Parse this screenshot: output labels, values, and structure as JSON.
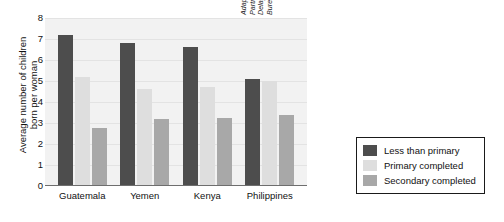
{
  "chart_data": {
    "type": "bar",
    "title": "",
    "xlabel": "",
    "ylabel": "Average number of children\nborn per woman",
    "ylim": [
      0,
      8
    ],
    "yticks": [
      "8",
      "7",
      "6",
      "5",
      "4",
      "3",
      "2",
      "1",
      "0"
    ],
    "grid": true,
    "legend_position": "right",
    "categories": [
      "Guatemala",
      "Yemen",
      "Kenya",
      "Philippines"
    ],
    "series": [
      {
        "name": "Less  than primary",
        "color": "#4d4d4d",
        "values": [
          7.2,
          6.8,
          6.6,
          5.1
        ]
      },
      {
        "name": "Primary completed",
        "color": "#dedede",
        "values": [
          5.2,
          4.6,
          4.7,
          5.0
        ]
      },
      {
        "name": "Secondary completed",
        "color": "#a8a8a8",
        "values": [
          2.75,
          3.2,
          3.25,
          3.4
        ]
      }
    ],
    "annotations": {
      "source": "Adapted from E. Murphy, and D. Carr, Powerful\nPartners: Adolescent Girls' Education and\nDelayed Childbearing Population Reference\nBureau (2007)"
    }
  }
}
